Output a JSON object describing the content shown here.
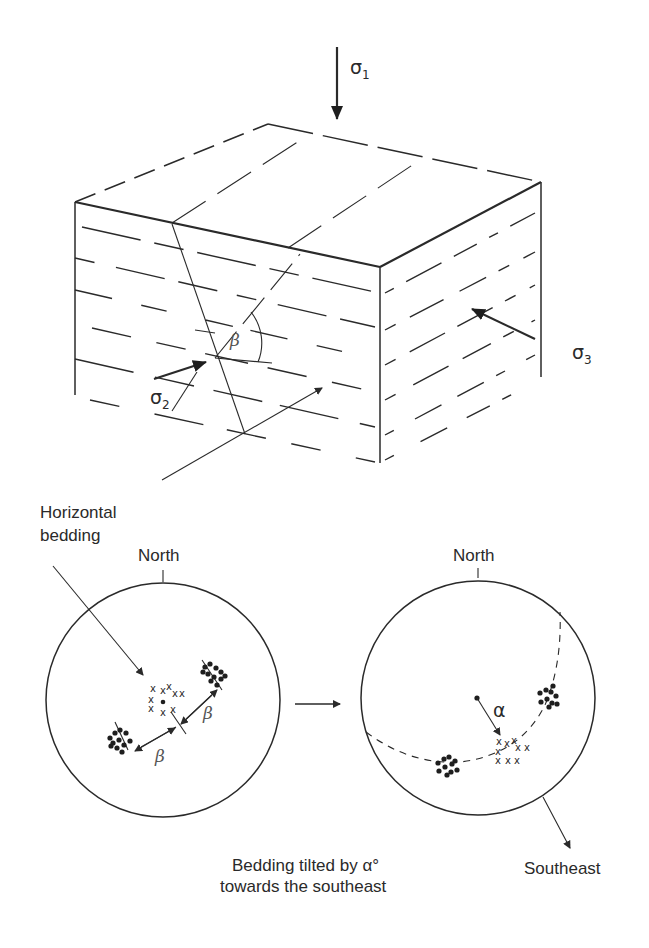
{
  "figure": {
    "block": {
      "stress_labels": {
        "sigma1": {
          "symbol": "σ",
          "sub": "1"
        },
        "sigma2": {
          "symbol": "σ",
          "sub": "2"
        },
        "sigma3": {
          "symbol": "σ",
          "sub": "3"
        }
      },
      "angle_label": "β"
    },
    "left_stereonet": {
      "callout": [
        "Horizontal",
        "bedding"
      ],
      "north_label": "North",
      "angle_label_upper": "β",
      "angle_label_lower": "β",
      "pole_marker": "x"
    },
    "transition_arrow": "→",
    "right_stereonet": {
      "north_label": "North",
      "tilt_label": "α",
      "direction_label": "Southeast",
      "pole_marker": "x"
    },
    "caption": [
      "Bedding tilted by α°",
      "towards the southeast"
    ]
  },
  "colors": {
    "ink": "#2a2a2a",
    "angle_label": "#555555",
    "background": "#ffffff"
  }
}
